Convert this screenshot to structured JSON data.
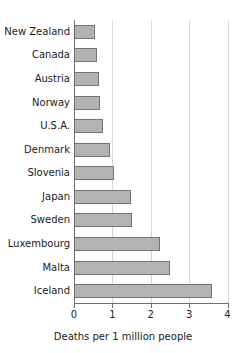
{
  "chart_data": {
    "type": "bar",
    "orientation": "horizontal",
    "title": "",
    "xlabel": "Deaths per 1 million people",
    "ylabel": "",
    "xlim": [
      0,
      4
    ],
    "xticks": [
      0,
      1,
      2,
      3,
      4
    ],
    "xtick_labels": [
      "0",
      "1",
      "2",
      "3",
      "4"
    ],
    "grid": "vertical",
    "legend": "none",
    "bar_color": "#b3b3b3",
    "bar_edge_color": "#737373",
    "categories": [
      "New Zealand",
      "Canada",
      "Austria",
      "Norway",
      "U.S.A.",
      "Denmark",
      "Slovenia",
      "Japan",
      "Sweden",
      "Luxembourg",
      "Malta",
      "Iceland"
    ],
    "values": [
      0.55,
      0.6,
      0.65,
      0.68,
      0.75,
      0.93,
      1.03,
      1.48,
      1.5,
      2.25,
      2.5,
      3.6
    ]
  }
}
